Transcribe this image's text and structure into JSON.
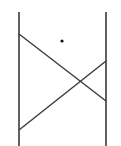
{
  "diagram": {
    "stroke_color": "#3a3a3a",
    "background": "#ffffff",
    "vertical_lines": [
      {
        "name": "left-post",
        "x": 19,
        "y1": 12,
        "y2": 146
      },
      {
        "name": "right-post",
        "x": 106,
        "y1": 12,
        "y2": 146
      }
    ],
    "diagonal_lines": [
      {
        "name": "descending-diagonal",
        "x1": 19,
        "y1": 34,
        "x2": 106,
        "y2": 101
      },
      {
        "name": "ascending-diagonal",
        "x1": 19,
        "y1": 130,
        "x2": 106,
        "y2": 61
      }
    ],
    "dot": {
      "cx": 62,
      "cy": 41,
      "r": 1.6
    }
  }
}
